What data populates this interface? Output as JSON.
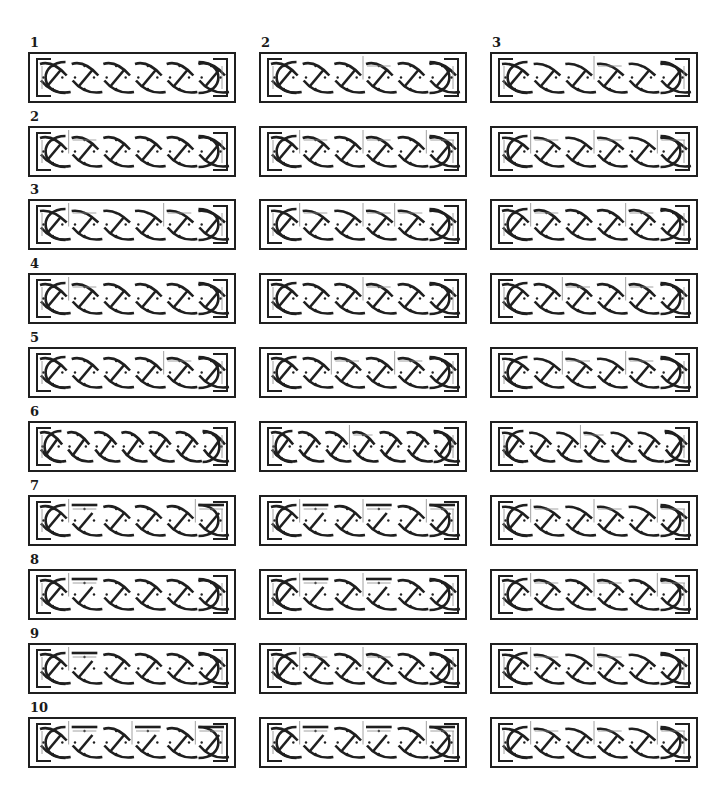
{
  "column_headers": [
    "1",
    "2",
    "3"
  ],
  "row_labels": [
    "1",
    "2",
    "3",
    "4",
    "5",
    "6",
    "7",
    "8",
    "9",
    "10"
  ],
  "layout": {
    "col_x": [
      28,
      259,
      490
    ],
    "row_y": [
      52,
      126,
      199,
      273,
      347,
      421,
      495,
      569,
      643,
      717
    ],
    "panel_w": 208,
    "panel_h": 51
  },
  "colors": {
    "stroke": "#1f1f1f",
    "guide": "#8a8a8a",
    "background": "#ffffff"
  },
  "rows": [
    {
      "label": "1",
      "variants": [
        {
          "cells": 6,
          "breaks": [],
          "style": "plait"
        },
        {
          "cells": 6,
          "breaks": [
            3
          ],
          "style": "plait"
        },
        {
          "cells": 6,
          "breaks": [
            3
          ],
          "style": "plait-low"
        }
      ]
    },
    {
      "label": "2",
      "variants": [
        {
          "cells": 6,
          "breaks": [
            1
          ],
          "style": "plait"
        },
        {
          "cells": 6,
          "breaks": [
            1,
            3,
            5
          ],
          "style": "plait"
        },
        {
          "cells": 6,
          "breaks": [
            1,
            3,
            5
          ],
          "style": "plait-low"
        }
      ]
    },
    {
      "label": "3",
      "variants": [
        {
          "cells": 6,
          "breaks": [
            1,
            4
          ],
          "style": "plait-low"
        },
        {
          "cells": 6,
          "breaks": [
            1,
            3,
            4
          ],
          "style": "plait-low"
        },
        {
          "cells": 6,
          "breaks": [
            1,
            4
          ],
          "style": "plait"
        }
      ]
    },
    {
      "label": "4",
      "variants": [
        {
          "cells": 6,
          "breaks": [
            1
          ],
          "style": "plait"
        },
        {
          "cells": 6,
          "breaks": [
            3
          ],
          "style": "plait"
        },
        {
          "cells": 6,
          "breaks": [
            2,
            4
          ],
          "style": "plait"
        }
      ]
    },
    {
      "label": "5",
      "variants": [
        {
          "cells": 6,
          "breaks": [
            4
          ],
          "style": "plait"
        },
        {
          "cells": 6,
          "breaks": [
            2,
            4
          ],
          "style": "plait"
        },
        {
          "cells": 6,
          "breaks": [
            2,
            4
          ],
          "style": "plait-low"
        }
      ]
    },
    {
      "label": "6",
      "variants": [
        {
          "cells": 7,
          "breaks": [],
          "style": "plait"
        },
        {
          "cells": 7,
          "breaks": [
            3
          ],
          "style": "plait"
        },
        {
          "cells": 7,
          "breaks": [
            3
          ],
          "style": "plait-low"
        }
      ]
    },
    {
      "label": "7",
      "variants": [
        {
          "cells": 6,
          "breaks": [
            1,
            5
          ],
          "style": "plait-top"
        },
        {
          "cells": 6,
          "breaks": [
            1,
            3,
            5
          ],
          "style": "plait-top"
        },
        {
          "cells": 6,
          "breaks": [
            1,
            3,
            5
          ],
          "style": "plait-low"
        }
      ]
    },
    {
      "label": "8",
      "variants": [
        {
          "cells": 6,
          "breaks": [
            1
          ],
          "style": "plait-top"
        },
        {
          "cells": 6,
          "breaks": [
            1,
            3
          ],
          "style": "plait-top"
        },
        {
          "cells": 6,
          "breaks": [
            1,
            3,
            5
          ],
          "style": "plait"
        }
      ]
    },
    {
      "label": "9",
      "variants": [
        {
          "cells": 6,
          "breaks": [
            1
          ],
          "style": "plait-top"
        },
        {
          "cells": 6,
          "breaks": [
            1,
            3
          ],
          "style": "plait"
        },
        {
          "cells": 6,
          "breaks": [
            1,
            3
          ],
          "style": "plait-low"
        }
      ]
    },
    {
      "label": "10",
      "variants": [
        {
          "cells": 6,
          "breaks": [
            1,
            3,
            5
          ],
          "style": "plait-top"
        },
        {
          "cells": 6,
          "breaks": [
            1,
            3,
            5
          ],
          "style": "plait-top"
        },
        {
          "cells": 6,
          "breaks": [
            1,
            3,
            5
          ],
          "style": "plait-low"
        }
      ]
    }
  ]
}
